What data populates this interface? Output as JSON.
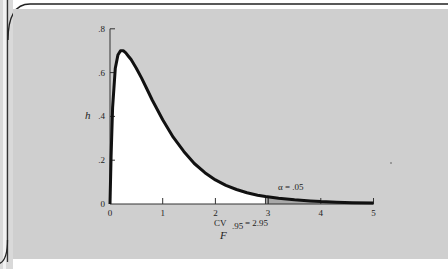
{
  "chart_data": {
    "type": "area",
    "title": "",
    "xlabel": "F",
    "ylabel": "h",
    "xlim": [
      0,
      5
    ],
    "ylim": [
      0,
      0.8
    ],
    "x_ticks": [
      0,
      1,
      2,
      3,
      4,
      5
    ],
    "x_tick_labels": [
      "0",
      "1",
      "2",
      "3",
      "4",
      "5"
    ],
    "y_ticks": [
      0,
      0.2,
      0.4,
      0.6,
      0.8
    ],
    "y_tick_labels": [
      "0",
      ".2",
      ".4",
      ".6",
      ".8"
    ],
    "grid": false,
    "legend": null,
    "series": [
      {
        "name": "F density",
        "x": [
          0,
          0.02,
          0.05,
          0.1,
          0.15,
          0.2,
          0.25,
          0.3,
          0.35,
          0.4,
          0.5,
          0.6,
          0.7,
          0.8,
          0.9,
          1.0,
          1.2,
          1.4,
          1.6,
          1.8,
          2.0,
          2.2,
          2.4,
          2.6,
          2.8,
          2.95,
          3.2,
          3.5,
          3.8,
          4.0,
          4.3,
          4.6,
          5.0
        ],
        "y": [
          0,
          0.22,
          0.44,
          0.62,
          0.68,
          0.7,
          0.7,
          0.69,
          0.675,
          0.66,
          0.62,
          0.575,
          0.525,
          0.475,
          0.43,
          0.385,
          0.305,
          0.24,
          0.185,
          0.143,
          0.11,
          0.085,
          0.066,
          0.051,
          0.04,
          0.034,
          0.026,
          0.019,
          0.014,
          0.011,
          0.008,
          0.006,
          0.004
        ]
      }
    ],
    "shaded_region": {
      "from": 2.95,
      "to": 5,
      "label": "α  =  .05"
    },
    "annotations": [
      {
        "text": "α  =  .05",
        "x": 3.4,
        "y": 0.07
      },
      {
        "text": "CV.95 = 2.95",
        "x": 2.95,
        "y": -0.1
      }
    ]
  },
  "labels": {
    "y_axis": "h",
    "x_axis": "F",
    "alpha": "α  =  .05",
    "cv_prefix": "CV",
    "cv_subscript": ".95",
    "cv_value": "=  2.95"
  },
  "colors": {
    "panel": "#cfcfcf",
    "curve": "#111111",
    "under_curve": "#ffffff",
    "tail_shade": "#a8a8a8",
    "frame_line": "#222222"
  }
}
